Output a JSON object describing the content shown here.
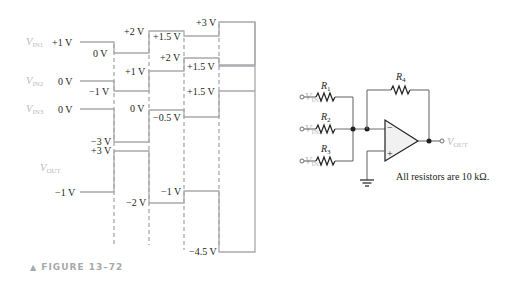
{
  "figure": {
    "caption": "FIGURE 13–72",
    "caption_marker": "▲"
  },
  "waveforms": {
    "signals": [
      {
        "name": "V",
        "sub": "IN1",
        "levels": [
          "+1 V",
          "0 V",
          "+2 V",
          "+1.5 V",
          "+3 V"
        ]
      },
      {
        "name": "V",
        "sub": "IN2",
        "levels": [
          "0 V",
          "−1 V",
          "+1 V",
          "+2 V",
          "+1.5 V"
        ]
      },
      {
        "name": "V",
        "sub": "IN3",
        "levels": [
          "0 V",
          "−3 V",
          "0 V",
          "−0.5 V",
          "+1.5 V"
        ]
      },
      {
        "name": "V",
        "sub": "OUT",
        "levels": [
          "−1 V",
          "+3 V",
          "−2 V",
          "−1 V",
          "−4.5 V"
        ]
      }
    ]
  },
  "circuit": {
    "resistors": [
      "R",
      "R",
      "R",
      "R"
    ],
    "resistor_subs": [
      "1",
      "2",
      "3",
      "4"
    ],
    "inputs": [
      {
        "name": "V",
        "sub": "IN1"
      },
      {
        "name": "V",
        "sub": "IN2"
      },
      {
        "name": "V",
        "sub": "IN3"
      }
    ],
    "output": {
      "name": "V",
      "sub": "OUT"
    },
    "opamp_inputs": [
      "−",
      "+"
    ],
    "note": "All resistors are 10 kΩ."
  }
}
